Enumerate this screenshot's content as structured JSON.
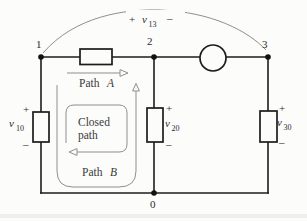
{
  "figure": {
    "type": "circuit-diagram",
    "bg_color": "#fcfcfb",
    "wire_color": "#1c1c1c",
    "annotation_color": "#8f8f8f",
    "nodes": [
      {
        "id": "node-1",
        "label": "1"
      },
      {
        "id": "node-2",
        "label": "2"
      },
      {
        "id": "node-3",
        "label": "3"
      },
      {
        "id": "node-0",
        "label": "0"
      }
    ],
    "top_voltage": {
      "plus": "+",
      "symbol": "v",
      "subscript": "13",
      "minus": "–"
    },
    "voltages": {
      "v10": {
        "plus": "+",
        "symbol": "v",
        "subscript": "10",
        "minus": "–"
      },
      "v20": {
        "plus": "+",
        "symbol": "v",
        "subscript": "20",
        "minus": "–"
      },
      "v30": {
        "plus": "+",
        "symbol": "v",
        "subscript": "30",
        "minus": "–"
      }
    },
    "paths": {
      "path_a": {
        "word": "Path",
        "letter": "A"
      },
      "path_b": {
        "word": "Path",
        "letter": "B"
      },
      "closed_path": {
        "line1": "Closed",
        "line2": "path"
      }
    }
  }
}
